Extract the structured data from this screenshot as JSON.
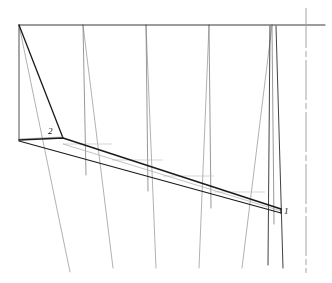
{
  "drawing": {
    "title": "Technical line drawing",
    "type": "engineering-line-diagram",
    "canvas": {
      "width": 332,
      "height": 283,
      "background": "#ffffff"
    },
    "colors": {
      "heavy_line": "#1a1a1a",
      "medium_line": "#555555",
      "light_line": "#8c8c8c",
      "faint_line": "#b0b0b0",
      "centerline": "#9a9a9a",
      "label_text": "#111111"
    },
    "callouts": [
      {
        "id": "callout-1",
        "label": "1",
        "x": 284,
        "y": 207
      },
      {
        "id": "callout-2",
        "label": "2",
        "x": 48,
        "y": 127
      }
    ],
    "top_rail": {
      "x1": 19,
      "y1": 25,
      "x2": 325,
      "y2": 25
    },
    "left_edge": {
      "x1": 19,
      "y1": 25,
      "x2": 19,
      "y2": 140
    },
    "lead_diagonal": {
      "x1": 19,
      "y1": 25,
      "x2": 63,
      "y2": 138
    },
    "centerline": {
      "x": 306,
      "y_top": 8,
      "y_bottom": 273,
      "dash_pattern": "40 3 6 3"
    },
    "band": {
      "top_edge": [
        {
          "x": 19,
          "y": 140
        },
        {
          "x": 63,
          "y": 138
        },
        {
          "x": 281,
          "y": 209
        }
      ],
      "bottom_edge": [
        {
          "x": 19,
          "y": 141
        },
        {
          "x": 281,
          "y": 213
        }
      ],
      "inner_light_edge": [
        {
          "x": 63,
          "y": 144
        },
        {
          "x": 281,
          "y": 211
        }
      ]
    },
    "generator_pairs": [
      {
        "name": "generator-pair-1",
        "top_x": 19,
        "vertical_bottom_x": 19,
        "slant_bottom_x": 70,
        "slant_bottom_y": 272
      },
      {
        "name": "generator-pair-2",
        "top_x": 83,
        "vertical_bottom_x": 83,
        "slant_bottom_x": 113,
        "slant_bottom_y": 268
      },
      {
        "name": "generator-pair-3",
        "top_x": 146,
        "vertical_bottom_x": 146,
        "slant_bottom_x": 156,
        "slant_bottom_y": 268
      },
      {
        "name": "generator-pair-4",
        "top_x": 209,
        "vertical_bottom_x": 209,
        "slant_bottom_x": 199,
        "slant_bottom_y": 268
      },
      {
        "name": "generator-pair-5",
        "top_x": 272,
        "vertical_bottom_x": 272,
        "slant_bottom_x": 242,
        "slant_bottom_y": 268
      }
    ],
    "right_verticals": [
      {
        "name": "right-vertical-inner",
        "x_top": 270,
        "y_top": 25,
        "x_bottom": 268,
        "y_bottom": 265
      },
      {
        "name": "right-vertical-outer",
        "x_top": 276,
        "y_top": 25,
        "x_bottom": 283,
        "y_bottom": 268
      }
    ],
    "band_tick_marks": [
      {
        "name": "band-tick-1",
        "x1": 63,
        "y1": 144,
        "x2": 112,
        "y2": 144
      },
      {
        "name": "band-tick-2",
        "x1": 112,
        "y1": 160,
        "x2": 163,
        "y2": 160
      },
      {
        "name": "band-tick-3",
        "x1": 163,
        "y1": 176,
        "x2": 214,
        "y2": 176
      },
      {
        "name": "band-tick-4",
        "x1": 214,
        "y1": 192,
        "x2": 265,
        "y2": 192
      }
    ],
    "callout-2-leader": {
      "x1": 19,
      "y1": 140,
      "x2": 63,
      "y2": 138
    }
  }
}
